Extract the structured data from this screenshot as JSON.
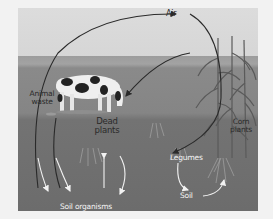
{
  "diagram": {
    "type": "nitrogen-cycle-illustration",
    "labels": {
      "air": "Air",
      "animal_waste_line1": "Animal",
      "animal_waste_line2": "waste",
      "dead_plants_line1": "Dead",
      "dead_plants_line2": "plants",
      "corn_plants_line1": "Corn",
      "corn_plants_line2": "plants",
      "legumes": "Legumes",
      "soil": "Soil",
      "soil_organisms": "Soil organisms"
    },
    "flows": [
      {
        "from": "Soil organisms",
        "to": "Air"
      },
      {
        "from": "Air",
        "to": "Legumes"
      },
      {
        "from": "Corn plants",
        "to": "Cow"
      },
      {
        "from": "Animal waste",
        "to": "Soil organisms"
      },
      {
        "from": "Dead plants",
        "to": "Soil organisms"
      },
      {
        "from": "Soil organisms",
        "to": "Soil"
      },
      {
        "from": "Legumes",
        "to": "Soil"
      },
      {
        "from": "Soil",
        "to": "Corn plants"
      }
    ],
    "colors": {
      "sky": "#d8d8d8",
      "horizon": "#9c9c9c",
      "ground": "#858585",
      "soil": "#6c6c6c",
      "arrow_dark": "#2a2a2a",
      "arrow_light": "#f2f2f2"
    }
  }
}
